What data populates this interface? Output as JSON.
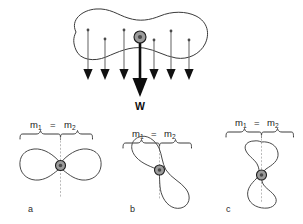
{
  "figure": {
    "title_text": "",
    "background_color": "#ffffff",
    "line_color": "#3a3a3a",
    "arrow_color": "#6e6e6e",
    "weight_color": "#0d0d0d",
    "cg_fill_color": "#9b9b9b",
    "axis_color": "#a8a8a8"
  },
  "top_diagram": {
    "name": "distributed-weight-diagram",
    "weight_label": "W",
    "description_icon": "blob-shape",
    "cg_marker": "center-of-gravity-dot",
    "small_arrows_count": 6,
    "small_arrow_x_positions": [
      88,
      105,
      124,
      154,
      171,
      189
    ],
    "small_arrow_top_y": [
      30,
      39,
      30,
      40,
      31,
      40
    ],
    "small_arrow_bottom_y": [
      78,
      78,
      78,
      78,
      78,
      78
    ],
    "weight_arrow_x": 140,
    "weight_arrow_top_y": 42,
    "weight_arrow_bottom_y": 95,
    "cg_x": 140,
    "cg_y": 38
  },
  "panels": [
    {
      "id": "a",
      "label": "a",
      "mass_left": "m",
      "mass_left_sub": "1",
      "equals": "=",
      "mass_right": "m",
      "mass_right_sub": "2",
      "orientation": "horizontal",
      "cg_marker": "center-of-gravity-dot"
    },
    {
      "id": "b",
      "label": "b",
      "mass_left": "m",
      "mass_left_sub": "1",
      "equals": "=",
      "mass_right": "m",
      "mass_right_sub": "2",
      "orientation": "tilted",
      "cg_marker": "center-of-gravity-dot"
    },
    {
      "id": "c",
      "label": "c",
      "mass_left": "m",
      "mass_left_sub": "1",
      "equals": "=",
      "mass_right": "m",
      "mass_right_sub": "2",
      "orientation": "vertical",
      "cg_marker": "center-of-gravity-dot"
    }
  ]
}
